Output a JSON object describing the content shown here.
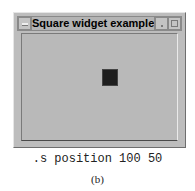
{
  "window": {
    "title": "Square widget example",
    "buttons": [
      "menu-icon",
      "minimize-icon",
      "maximize-icon"
    ]
  },
  "canvas": {
    "square": {
      "x": 80,
      "y": 35,
      "size": 16,
      "color": "#1e1e1e"
    }
  },
  "command": ".s position 100 50",
  "caption": "(b)"
}
